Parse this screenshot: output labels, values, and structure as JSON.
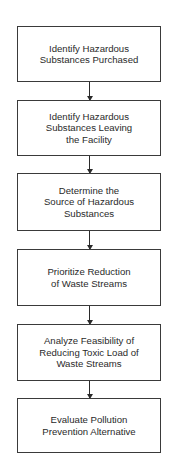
{
  "diagram": {
    "type": "flowchart",
    "direction": "top-to-bottom",
    "colors": {
      "background": "#ffffff",
      "border": "#3a3a3a",
      "text": "#2a2a2a",
      "arrow": "#2a2a2a"
    },
    "steps": [
      {
        "label": "Identify Hazardous\nSubstances Purchased"
      },
      {
        "label": "Identify Hazardous\nSubstances Leaving\nthe Facility"
      },
      {
        "label": "Determine the\nSource of Hazardous\nSubstances"
      },
      {
        "label": "Prioritize Reduction\nof Waste Streams"
      },
      {
        "label": "Analyze Feasibility of\nReducing Toxic Load of\nWaste Streams"
      },
      {
        "label": "Evaluate Pollution\nPrevention Alternative"
      }
    ],
    "connections": [
      {
        "from": 0,
        "to": 1
      },
      {
        "from": 1,
        "to": 2
      },
      {
        "from": 2,
        "to": 3
      },
      {
        "from": 3,
        "to": 4
      },
      {
        "from": 4,
        "to": 5
      }
    ]
  }
}
